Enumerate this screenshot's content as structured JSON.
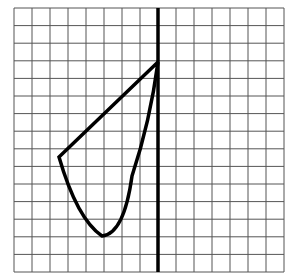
{
  "figure": {
    "grid": {
      "columns": 15,
      "rows": 15,
      "left": 14,
      "top": 8,
      "cell_width": 18,
      "cell_height": 17.6,
      "line_color": "#555555"
    },
    "mirror_line": {
      "x": 158,
      "y1": 8,
      "y2": 272,
      "color": "#000000"
    },
    "shape": {
      "color": "#000000",
      "apex": [
        158,
        62
      ],
      "left_vertex": [
        59,
        157
      ],
      "bottom_point": [
        102,
        236
      ]
    }
  }
}
